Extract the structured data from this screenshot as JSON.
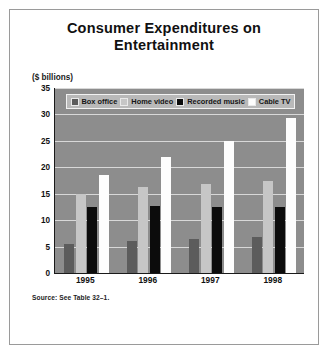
{
  "figure": {
    "title": "Consumer Expenditures on Entertainment",
    "units_label": "($ billions)",
    "source_note": "Source: See Table 32–1."
  },
  "chart_data": {
    "type": "bar",
    "title": "Consumer Expenditures on Entertainment",
    "xlabel": "",
    "ylabel": "($ billions)",
    "ylim": [
      0,
      35
    ],
    "yticks": [
      0,
      5,
      10,
      15,
      20,
      25,
      30,
      35
    ],
    "ytick_labels": [
      "0",
      "5",
      "10",
      "15",
      "20",
      "25",
      "30",
      "35"
    ],
    "grid": true,
    "legend_position": "top-inside",
    "categories": [
      "1995",
      "1996",
      "1997",
      "1998"
    ],
    "series": [
      {
        "name": "Box office",
        "color": "#5c5c5c",
        "values": [
          5.5,
          6.0,
          6.5,
          6.8
        ]
      },
      {
        "name": "Home video",
        "color": "#c6c6c6",
        "values": [
          15.0,
          16.2,
          16.8,
          17.5
        ]
      },
      {
        "name": "Recorded music",
        "color": "#0c0c0c",
        "values": [
          12.5,
          12.7,
          12.4,
          12.4
        ]
      },
      {
        "name": "Cable TV",
        "color": "#fdfdfd",
        "values": [
          18.5,
          22.0,
          25.0,
          29.3
        ]
      }
    ],
    "plot_background": "#8d8d8d",
    "gridline_color": "#d8d8d8",
    "axis_color": "#1a1a1a"
  }
}
